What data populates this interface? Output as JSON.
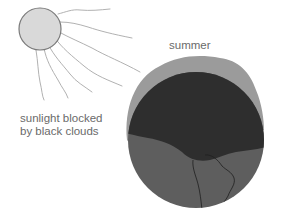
{
  "labels": {
    "season": "summer",
    "blocked_line1": "sunlight blocked",
    "blocked_line2": "by black clouds"
  },
  "colors": {
    "sun_fill": "#d9d9d9",
    "sun_stroke": "#7a7a7a",
    "ray": "#a8a8a8",
    "haze": "#9b9b9b",
    "cloud": "#2e2e2e",
    "earth": "#5e5e5e",
    "coastline": "#1f1f1f",
    "text": "#6a6a6a"
  },
  "elements": {
    "sun": "sun-icon",
    "earth": "earth-globe",
    "cloud_layer": "black-cloud-layer",
    "haze_layer": "atmosphere-haze"
  }
}
